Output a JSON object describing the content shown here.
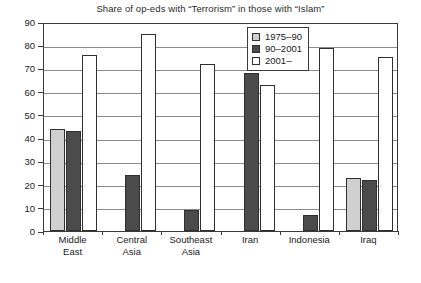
{
  "chart_data": {
    "type": "bar",
    "title": "Share of op-eds with “Terrorism” in those with “Islam”",
    "xlabel": "",
    "ylabel": "",
    "ylim": [
      0,
      90
    ],
    "ytick_step": 10,
    "yticks": [
      0,
      10,
      20,
      30,
      40,
      50,
      60,
      70,
      80,
      90
    ],
    "ytick_labels": [
      "0",
      "10",
      "20",
      "30",
      "40",
      "50",
      "60",
      "70",
      "80",
      "90"
    ],
    "grid": true,
    "grid_axis": "y",
    "legend_position": "top-right-inside",
    "categories": [
      "Middle East",
      "Central Asia",
      "Southeast Asia",
      "Iran",
      "Indonesia",
      "Iraq"
    ],
    "category_lines": [
      [
        "Middle",
        "East"
      ],
      [
        "Central",
        "Asia"
      ],
      [
        "Southeast",
        "Asia"
      ],
      [
        "Iran"
      ],
      [
        "Indonesia"
      ],
      [
        "Iraq"
      ]
    ],
    "series": [
      {
        "name": "1975–90",
        "color": "#cfcfcf",
        "values": [
          44,
          null,
          null,
          null,
          null,
          23
        ]
      },
      {
        "name": "90–2001",
        "color": "#4b4b4b",
        "values": [
          43,
          24,
          9,
          68,
          7,
          22
        ]
      },
      {
        "name": "2001–",
        "color": "#ffffff",
        "values": [
          76,
          85,
          72,
          63,
          79,
          75
        ]
      }
    ]
  },
  "legend": {
    "items": [
      {
        "label": "1975–90",
        "swatch": "light-gray"
      },
      {
        "label": "90–2001",
        "swatch": "dark-gray"
      },
      {
        "label": "2001–",
        "swatch": "white"
      }
    ]
  },
  "colors": {
    "series_1975_90": "#cfcfcf",
    "series_90_2001": "#4b4b4b",
    "series_2001_on": "#ffffff",
    "axis": "#3a3a3a",
    "gridline": "#8d8d8d",
    "background": "#ffffff"
  }
}
